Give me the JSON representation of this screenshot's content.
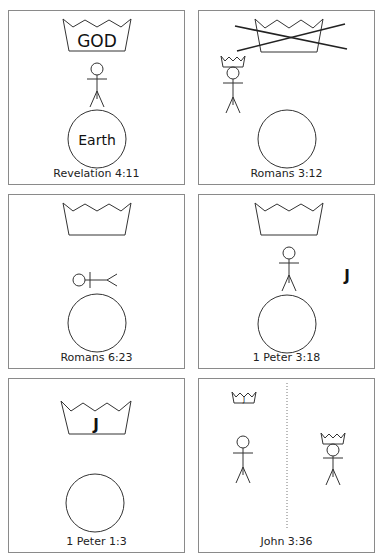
{
  "panels": [
    {
      "id": 1,
      "caption": "Revelation 4:11",
      "crown_text": "GOD",
      "circle_text": "Earth"
    },
    {
      "id": 2,
      "caption": "Romans 3:12"
    },
    {
      "id": 3,
      "caption": "Romans 6:23"
    },
    {
      "id": 4,
      "caption": "1 Peter 3:18",
      "side_text": "J"
    },
    {
      "id": 5,
      "caption": "1 Peter 1:3",
      "crown_text": "J"
    },
    {
      "id": 6,
      "caption": "John 3:36",
      "small_crown_text": "J"
    }
  ],
  "colors": {
    "stroke": "#333333",
    "border": "#8a8a8a",
    "cross": "#222222"
  }
}
